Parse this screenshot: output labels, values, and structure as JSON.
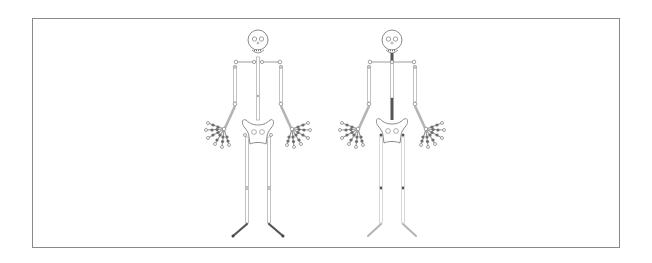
{
  "figure": {
    "description": "Two skeleton rig diagrams side by side",
    "frame_color": "#8a8a8a",
    "bone_color": "#c8c8c8",
    "joint_color": "#8c8c8c",
    "highlight_color": "#555555",
    "skeletons": [
      {
        "label": "skeleton-left",
        "cx": 258,
        "highlight": "feet",
        "notes": "Lower legs / feet drawn in dark (highlighted) bones"
      },
      {
        "label": "skeleton-right",
        "cx": 392,
        "highlight": "spine",
        "notes": "Spine and neck drawn in dark (highlighted) bones; knee joints dark"
      }
    ]
  }
}
